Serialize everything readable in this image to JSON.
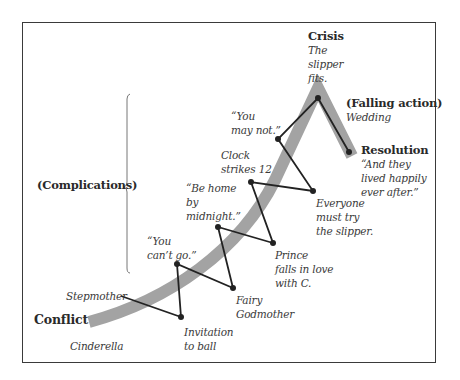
{
  "diagram": {
    "path_color": "#a3a3a3",
    "line_color": "#222222",
    "stages": {
      "conflict": {
        "title": "Conflict",
        "protagonist": "Cinderella",
        "antagonist": "Stepmother"
      },
      "complications": {
        "title": "(Complications)"
      },
      "crisis": {
        "title": "Crisis",
        "text": "The\nslipper\nfits."
      },
      "falling_action": {
        "title": "(Falling action)",
        "text": "Wedding"
      },
      "resolution": {
        "title": "Resolution",
        "text": "“And they\nlived happily\never after.”"
      }
    },
    "events": [
      {
        "label": "Invitation\nto ball",
        "x": 181,
        "y": 317
      },
      {
        "label": "“You\ncan’t go.”",
        "x": 177,
        "y": 264
      },
      {
        "label": "Fairy\nGodmother",
        "x": 233,
        "y": 288
      },
      {
        "label": "“Be home\nby\nmidnight.”",
        "x": 218,
        "y": 227
      },
      {
        "label": "Prince\nfalls in love\nwith C.",
        "x": 273,
        "y": 243
      },
      {
        "label": "Clock\nstrikes 12",
        "x": 251,
        "y": 182
      },
      {
        "label": "Everyone\nmust try\nthe slipper.",
        "x": 313,
        "y": 191
      },
      {
        "label": "“You\nmay not.”",
        "x": 278,
        "y": 139
      },
      {
        "label": "The slipper fits.",
        "x": 318,
        "y": 98
      },
      {
        "label": "Wedding",
        "x": 349,
        "y": 152
      }
    ]
  }
}
